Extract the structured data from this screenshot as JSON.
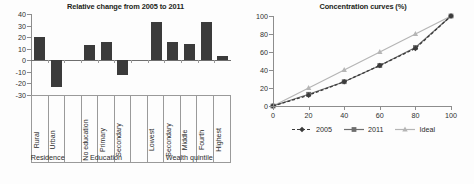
{
  "chart_data": [
    {
      "type": "bar",
      "title": "Relative change from 2005 to 2011",
      "xlabel": "",
      "ylabel": "",
      "ylim": [
        -30,
        40
      ],
      "ytick_labels": [
        "40",
        "30",
        "20",
        "10",
        "0",
        "-10",
        "-20",
        "-30"
      ],
      "yticks": [
        40,
        30,
        20,
        10,
        0,
        -10,
        -20,
        -30
      ],
      "grid": false,
      "bar_color": "#3b3b3b",
      "categories": [
        "Rural",
        "Urban",
        "No education",
        "Primary",
        "Secondary",
        "Lowest",
        "Secondary",
        "Middle",
        "Fourth",
        "Highest"
      ],
      "values": [
        20,
        -23,
        13,
        16,
        -13,
        33,
        16,
        14,
        33,
        4
      ],
      "groups": [
        {
          "label": "Residence",
          "categories": [
            "Rural",
            "Urban"
          ]
        },
        {
          "label": "Education",
          "categories": [
            "No education",
            "Primary",
            "Secondary"
          ]
        },
        {
          "label": "Wealth quintile",
          "categories": [
            "Lowest",
            "Secondary",
            "Middle",
            "Fourth",
            "Highest"
          ]
        }
      ]
    },
    {
      "type": "line",
      "title": "Concentration curves (%)",
      "xlabel": "",
      "ylabel": "",
      "xlim": [
        0,
        100
      ],
      "ylim": [
        0,
        100
      ],
      "xtick_labels": [
        "0",
        "20",
        "40",
        "60",
        "80",
        "100"
      ],
      "xticks": [
        0,
        20,
        40,
        60,
        80,
        100
      ],
      "ytick_labels": [
        "0",
        "20",
        "40",
        "60",
        "80",
        "100"
      ],
      "yticks": [
        0,
        20,
        40,
        60,
        80,
        100
      ],
      "grid": false,
      "legend_position": "bottom",
      "x": [
        0,
        20,
        40,
        60,
        80,
        100
      ],
      "series": [
        {
          "name": "2005",
          "values": [
            0,
            12,
            27,
            45,
            64,
            100
          ],
          "color": "#3b3b3b",
          "marker": "diamond",
          "linestyle": "dashed"
        },
        {
          "name": "2011",
          "values": [
            0,
            13,
            27,
            45,
            65,
            100
          ],
          "color": "#6e6e6e",
          "marker": "square",
          "linestyle": "solid"
        },
        {
          "name": "Ideal",
          "values": [
            0,
            20,
            40,
            60,
            80,
            100
          ],
          "color": "#b5b5b5",
          "marker": "triangle",
          "linestyle": "solid"
        }
      ]
    }
  ],
  "left": {
    "title": "Relative change from 2005 to 2011",
    "y_labels": [
      "40",
      "30",
      "20",
      "10",
      "0",
      "-10",
      "-20",
      "-30"
    ],
    "bars": [
      {
        "label": "Rural",
        "value": 20
      },
      {
        "label": "Urban",
        "value": -23
      },
      {
        "label": "No education",
        "value": 13
      },
      {
        "label": "Primary",
        "value": 16
      },
      {
        "label": "Secondary",
        "value": -13
      },
      {
        "label": "Lowest",
        "value": 33
      },
      {
        "label": "Secondary",
        "value": 16
      },
      {
        "label": "Middle",
        "value": 14
      },
      {
        "label": "Fourth",
        "value": 33
      },
      {
        "label": "Highest",
        "value": 4
      }
    ],
    "group_labels": [
      "Residence",
      "Education",
      "Wealth quintile"
    ]
  },
  "right": {
    "title": "Concentration curves (%)",
    "y_labels": [
      "100",
      "80",
      "60",
      "40",
      "20",
      "0"
    ],
    "x_labels": [
      "0",
      "20",
      "40",
      "60",
      "80",
      "100"
    ],
    "legend": [
      {
        "name": "2005"
      },
      {
        "name": "2011"
      },
      {
        "name": "Ideal"
      }
    ]
  }
}
